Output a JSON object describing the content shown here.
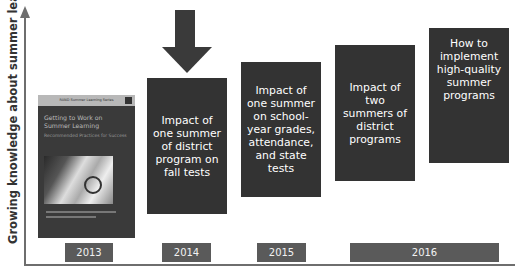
{
  "y_axis": {
    "label": "Growing knowledge about summer learning"
  },
  "book_cover": {
    "series": "RAND Summer Learning Series",
    "title": "Getting to Work on Summer Learning",
    "subtitle": "Recommended Practices for Success"
  },
  "stages": [
    {
      "year": "2013",
      "type": "book-cover"
    },
    {
      "year": "2014",
      "text": "Impact of one summer of district program on fall tests",
      "highlighted": true
    },
    {
      "year": "2015",
      "text": "Impact of one summer on school-year grades, attendance, and state tests"
    },
    {
      "year": "2016",
      "text": "Impact of two summers of district programs"
    },
    {
      "year": "2016",
      "text": "How to implement high-quality summer programs"
    }
  ],
  "years": [
    "2013",
    "2014",
    "2015",
    "2016"
  ],
  "colors": {
    "box": "#333333",
    "year_label": "#5a5a5a",
    "axis": "#6e6e6e"
  }
}
